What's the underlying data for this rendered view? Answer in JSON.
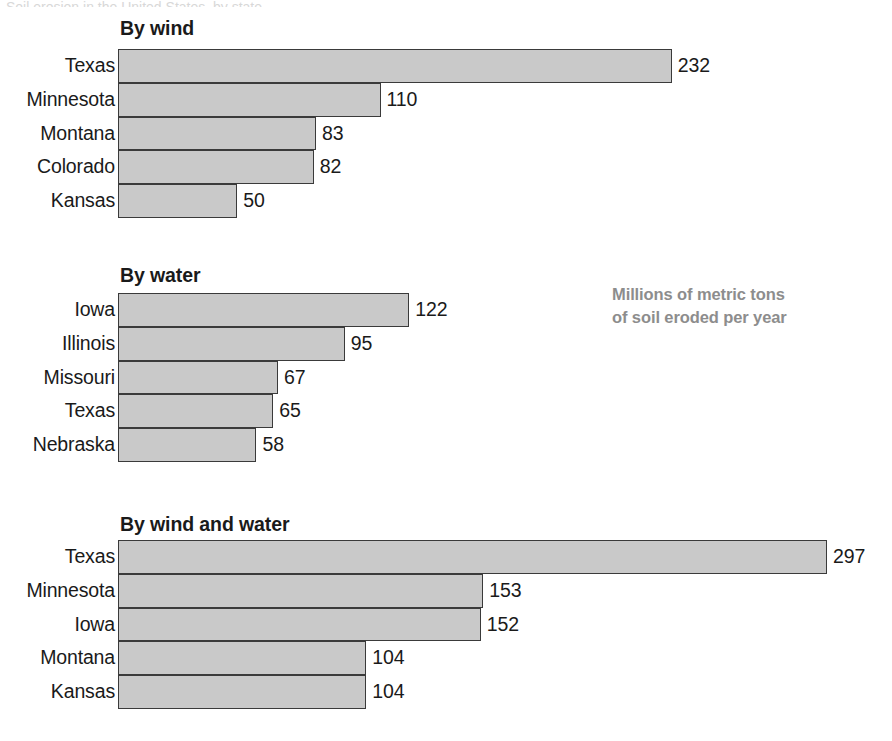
{
  "artifact": {
    "top_cut_text": "Soil erosion in the United States, by state"
  },
  "caption": {
    "line1": "Millions of metric tons",
    "line2": "of soil eroded per year",
    "color": "#8d8d8d"
  },
  "style": {
    "bar_fill": "#c9c9c9",
    "bar_stroke": "#3a3a3a",
    "text_color": "#1a1a1a",
    "background": "#ffffff"
  },
  "chart_data": [
    {
      "type": "bar",
      "orientation": "horizontal",
      "title": "By wind",
      "xlabel": "",
      "ylabel": "",
      "unit": "Millions of metric tons of soil eroded per year",
      "grid": false,
      "xlim": [
        0,
        297
      ],
      "px_per_unit": 2.387,
      "categories": [
        "Texas",
        "Minnesota",
        "Montana",
        "Colorado",
        "Kansas"
      ],
      "values": [
        232,
        110,
        83,
        82,
        50
      ],
      "value_labels": [
        "232",
        "110",
        "83",
        "82",
        "50"
      ]
    },
    {
      "type": "bar",
      "orientation": "horizontal",
      "title": "By water",
      "xlabel": "",
      "ylabel": "",
      "unit": "Millions of metric tons of soil eroded per year",
      "grid": false,
      "xlim": [
        0,
        297
      ],
      "px_per_unit": 2.387,
      "categories": [
        "Iowa",
        "Illinois",
        "Missouri",
        "Texas",
        "Nebraska"
      ],
      "values": [
        122,
        95,
        67,
        65,
        58
      ],
      "value_labels": [
        "122",
        "95",
        "67",
        "65",
        "58"
      ]
    },
    {
      "type": "bar",
      "orientation": "horizontal",
      "title": "By wind and water",
      "xlabel": "",
      "ylabel": "",
      "unit": "Millions of metric tons of soil eroded per year",
      "grid": false,
      "xlim": [
        0,
        297
      ],
      "px_per_unit": 2.387,
      "categories": [
        "Texas",
        "Minnesota",
        "Iowa",
        "Montana",
        "Kansas"
      ],
      "values": [
        297,
        153,
        152,
        104,
        104
      ],
      "value_labels": [
        "297",
        "153",
        "152",
        "104",
        "104"
      ]
    }
  ]
}
